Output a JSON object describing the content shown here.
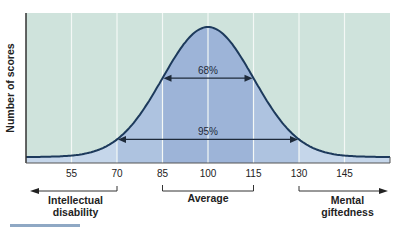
{
  "chart_data": {
    "type": "area",
    "title": "",
    "xlabel": "",
    "ylabel": "Number of scores",
    "x_ticks": [
      55,
      70,
      85,
      100,
      115,
      130,
      145
    ],
    "x_tick_labels": [
      "55",
      "70",
      "85",
      "100",
      "115",
      "130",
      "145"
    ],
    "xlim": [
      40,
      160
    ],
    "distribution": {
      "kind": "normal",
      "mean": 100,
      "sd": 15
    },
    "grid": {
      "vertical": true,
      "horizontal": false
    },
    "annotations": [
      {
        "label": "68%",
        "from": 85,
        "to": 115
      },
      {
        "label": "95%",
        "from": 70,
        "to": 130
      }
    ],
    "ranges": [
      {
        "label": "Intellectual disability",
        "line1": "Intellectual",
        "line2": "disability",
        "to": 70,
        "direction": "left"
      },
      {
        "label": "Average",
        "line1": "Average",
        "from": 85,
        "to": 115,
        "direction": "bracket"
      },
      {
        "label": "Mental giftedness",
        "line1": "Mental",
        "line2": "giftedness",
        "from": 130,
        "direction": "right"
      }
    ],
    "colors": {
      "background": "#cfe3dc",
      "curve_fill_outer": "#c5d6ea",
      "curve_fill_mid": "#aec3e0",
      "curve_fill_center": "#9db4d8",
      "curve_line": "#1d3a5c",
      "gridline": "#f4f8f6",
      "axis": "#333333"
    }
  }
}
